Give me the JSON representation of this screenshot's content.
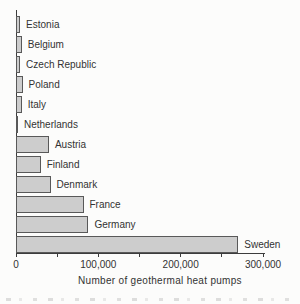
{
  "colors": {
    "background": "#fcfcfb",
    "bar_fill": "#cdcdcd",
    "bar_border": "#595959",
    "axis": "#3c3c3c",
    "text": "#333333"
  },
  "chart_data": {
    "type": "bar",
    "orientation": "horizontal",
    "title": "",
    "xlabel": "Number of geothermal heat pumps",
    "ylabel": "",
    "xlim": [
      0,
      300000
    ],
    "grid": false,
    "legend": false,
    "categories": [
      "Estonia",
      "Belgium",
      "Czech Republic",
      "Poland",
      "Italy",
      "Netherlands",
      "Austria",
      "Finland",
      "Denmark",
      "France",
      "Germany",
      "Sweden"
    ],
    "values": [
      5000,
      7000,
      5000,
      8000,
      7000,
      1000,
      40000,
      30000,
      42000,
      82000,
      88000,
      270000
    ],
    "bar_label_position": "right-of-bar",
    "ticks": [
      {
        "value": 0,
        "label": "0"
      },
      {
        "value": 50000,
        "label": ""
      },
      {
        "value": 100000,
        "label": "100,000"
      },
      {
        "value": 150000,
        "label": ""
      },
      {
        "value": 200000,
        "label": "200,000"
      },
      {
        "value": 250000,
        "label": ""
      },
      {
        "value": 300000,
        "label": "300,000"
      }
    ]
  },
  "figure": {
    "cropped_caption_present": true
  }
}
